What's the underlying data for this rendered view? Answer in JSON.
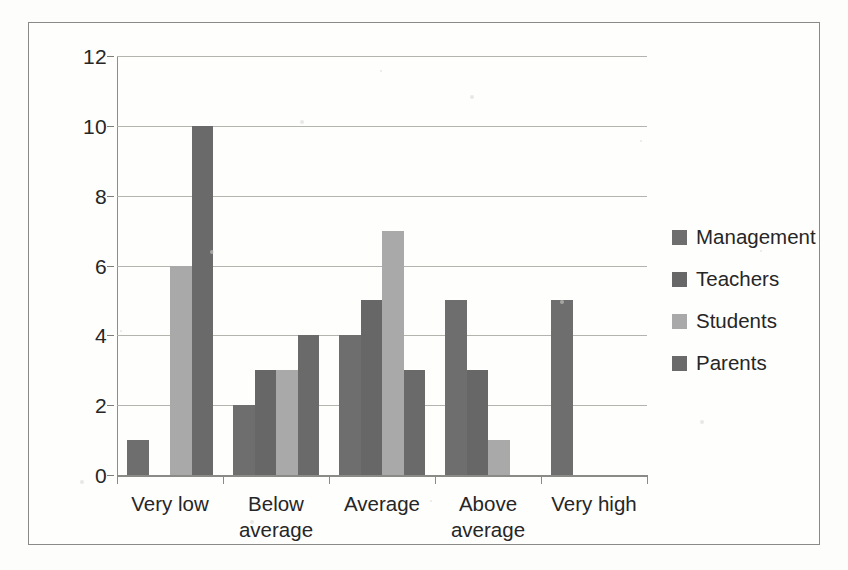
{
  "chart_data": {
    "type": "bar",
    "title": "",
    "xlabel": "",
    "ylabel": "",
    "ylim": [
      0,
      12
    ],
    "yticks": [
      0,
      2,
      4,
      6,
      8,
      10,
      12
    ],
    "grid": true,
    "legend_position": "right",
    "categories": [
      "Very low",
      "Below average",
      "Average",
      "Above average",
      "Very high"
    ],
    "category_lines": [
      [
        "Very low"
      ],
      [
        "Below",
        "average"
      ],
      [
        "Average"
      ],
      [
        "Above",
        "average"
      ],
      [
        "Very high"
      ]
    ],
    "series": [
      {
        "name": "Management",
        "color": "#6e6e6e",
        "values": [
          1,
          2,
          4,
          5,
          5
        ]
      },
      {
        "name": "Teachers",
        "color": "#676767",
        "values": [
          0,
          3,
          5,
          3,
          0
        ]
      },
      {
        "name": "Students",
        "color": "#a9a9a9",
        "values": [
          6,
          3,
          7,
          1,
          0
        ]
      },
      {
        "name": "Parents",
        "color": "#6a6a6a",
        "values": [
          10,
          4,
          3,
          0,
          0
        ]
      }
    ]
  },
  "legend": {
    "items": [
      {
        "label": "Management",
        "swatch": "#6e6e6e"
      },
      {
        "label": "Teachers",
        "swatch": "#676767"
      },
      {
        "label": "Students",
        "swatch": "#a9a9a9"
      },
      {
        "label": "Parents",
        "swatch": "#6a6a6a"
      }
    ]
  },
  "axis": {
    "y_tick_labels": [
      "0",
      "2",
      "4",
      "6",
      "8",
      "10",
      "12"
    ]
  }
}
